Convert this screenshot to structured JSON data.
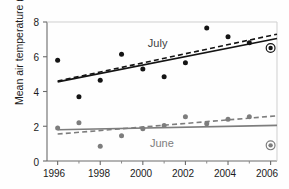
{
  "chart_data": {
    "type": "scatter",
    "title": "",
    "xlabel": "",
    "ylabel": "Mean air temperature (°C)",
    "xlim": [
      1995.5,
      2006.3
    ],
    "ylim": [
      0,
      8
    ],
    "yticks": [
      0,
      2,
      4,
      6,
      8
    ],
    "yticklabels": [
      "0",
      "2",
      "4",
      "6",
      "8"
    ],
    "xticks": [
      1996,
      1998,
      2000,
      2002,
      2004,
      2006
    ],
    "xticklabels": [
      "1996",
      "1998",
      "2000",
      "2002",
      "2004",
      "2006"
    ],
    "xminorticks": [
      1997,
      1999,
      2001,
      2003,
      2005
    ],
    "grid": false,
    "legend_position": "inline-annotation",
    "x": [
      1996,
      1997,
      1998,
      1999,
      2000,
      2001,
      2002,
      2003,
      2004,
      2005,
      2006
    ],
    "series": [
      {
        "name": "July",
        "color": "#141414",
        "marker": "filled-circle",
        "values": [
          5.8,
          3.7,
          4.65,
          6.15,
          5.3,
          4.85,
          5.65,
          7.65,
          7.15,
          6.8,
          6.5
        ],
        "highlighted_point": {
          "x": 2006,
          "y": 6.5,
          "marker": "circled-dot"
        },
        "trend_solid": {
          "x1": 1996,
          "y1": 4.55,
          "x2": 2006.3,
          "y2": 7.05
        },
        "trend_dashed": {
          "x1": 1996,
          "y1": 4.6,
          "x2": 2006.3,
          "y2": 7.3
        }
      },
      {
        "name": "June",
        "color": "#7d7d7d",
        "marker": "filled-circle",
        "values": [
          1.9,
          2.2,
          0.85,
          1.45,
          1.85,
          2.05,
          2.55,
          2.15,
          2.4,
          2.55,
          0.9
        ],
        "highlighted_point": {
          "x": 2006,
          "y": 0.9,
          "marker": "circled-dot"
        },
        "trend_solid": {
          "x1": 1996,
          "y1": 1.8,
          "x2": 2006.3,
          "y2": 2.05
        },
        "trend_dashed": {
          "x1": 1996,
          "y1": 1.55,
          "x2": 2006.3,
          "y2": 2.6
        }
      }
    ],
    "annotations": [
      {
        "text": "July",
        "x": 2000.8,
        "y": 6.75,
        "color": "#3d3d3d"
      },
      {
        "text": "June",
        "x": 2000.9,
        "y": 1.0,
        "color": "#7d7d7d"
      }
    ]
  },
  "axis": {
    "ylabel": "Mean air temperature (°C)",
    "ytick_0": "0",
    "ytick_2": "2",
    "ytick_4": "4",
    "ytick_6": "6",
    "ytick_8": "8",
    "xtick_1996": "1996",
    "xtick_1998": "1998",
    "xtick_2000": "2000",
    "xtick_2002": "2002",
    "xtick_2004": "2004",
    "xtick_2006": "2006"
  },
  "labels": {
    "july": "July",
    "june": "June"
  },
  "colors": {
    "july": "#141414",
    "june": "#7d7d7d",
    "axis": "#5a5a5a",
    "text": "#1b1b1b"
  }
}
